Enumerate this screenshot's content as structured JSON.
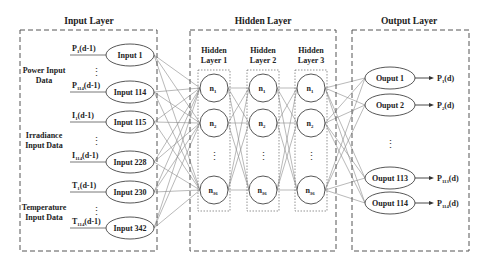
{
  "input_layer": {
    "title": "Input Layer",
    "groups": [
      {
        "label_line1": "Power Input",
        "label_line2": "Data"
      },
      {
        "label_line1": "Irradiance",
        "label_line2": "Input Data"
      },
      {
        "label_line1": "Temperature",
        "label_line2": "Input Data"
      }
    ],
    "nodes": [
      {
        "label": "Input 1",
        "signal": "P",
        "sub": "1",
        "suffix": "(d-1)"
      },
      {
        "label": "Input 114",
        "signal": "P",
        "sub": "114",
        "suffix": "(d-1)"
      },
      {
        "label": "Input 115",
        "signal": "I",
        "sub": "1",
        "suffix": "(d-1)"
      },
      {
        "label": "Input 228",
        "signal": "I",
        "sub": "114",
        "suffix": "(d-1)"
      },
      {
        "label": "Input 230",
        "signal": "T",
        "sub": "1",
        "suffix": "(d-1)"
      },
      {
        "label": "Input 342",
        "signal": "T",
        "sub": "114",
        "suffix": "(d-1)"
      }
    ]
  },
  "hidden_layer": {
    "title": "Hidden Layer",
    "layers": [
      {
        "line1": "Hidden",
        "line2": "Layer 1"
      },
      {
        "line1": "Hidden",
        "line2": "Layer 2"
      },
      {
        "line1": "Hidden",
        "line2": "Layer 3"
      }
    ],
    "neurons": [
      {
        "base": "n",
        "sub": "1"
      },
      {
        "base": "n",
        "sub": "2"
      },
      {
        "base": "n",
        "sub": "36"
      }
    ]
  },
  "output_layer": {
    "title": "Output Layer",
    "nodes": [
      {
        "label": "Ouput 1",
        "signal": "P",
        "sub": "1",
        "suffix": "(d)"
      },
      {
        "label": "Ouput 2",
        "signal": "P",
        "sub": "2",
        "suffix": "(d)"
      },
      {
        "label": "Ouput 113",
        "signal": "P",
        "sub": "113",
        "suffix": "(d)"
      },
      {
        "label": "Ouput 114",
        "signal": "P",
        "sub": "114",
        "suffix": "(d)"
      }
    ]
  },
  "ellipsis": "⋮"
}
